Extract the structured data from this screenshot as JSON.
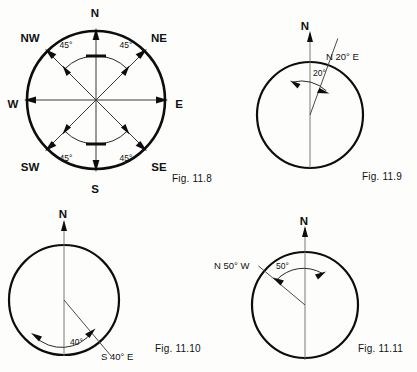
{
  "page": {
    "background_color": "#fdfdfc",
    "ink_color": "#0d0d0d",
    "width": 417,
    "height": 372
  },
  "figures": [
    {
      "id": "fig-11-8",
      "caption": "Fig. 11.8",
      "caption_x": 172,
      "caption_y": 182,
      "type": "compass-rose",
      "center_x": 96,
      "center_y": 100,
      "radius": 69,
      "cardinals": [
        {
          "label": "N",
          "bearing": 0,
          "lx": 95,
          "ly": 13
        },
        {
          "label": "NE",
          "bearing": 45,
          "lx": 156,
          "ly": 38
        },
        {
          "label": "E",
          "bearing": 90,
          "lx": 176,
          "ly": 104
        },
        {
          "label": "SE",
          "bearing": 135,
          "lx": 156,
          "ly": 167
        },
        {
          "label": "S",
          "bearing": 180,
          "lx": 95,
          "ly": 190
        },
        {
          "label": "SW",
          "bearing": 225,
          "lx": 26,
          "ly": 167
        },
        {
          "label": "W",
          "bearing": 270,
          "lx": 10,
          "ly": 104
        },
        {
          "label": "NW",
          "bearing": 315,
          "lx": 26,
          "ly": 38
        }
      ],
      "angle_labels": [
        {
          "text": "45°",
          "x": 66,
          "y": 45
        },
        {
          "text": "45°",
          "x": 124,
          "y": 45
        },
        {
          "text": "45°",
          "x": 66,
          "y": 158
        },
        {
          "text": "45°",
          "x": 124,
          "y": 158
        }
      ],
      "arcs": [
        {
          "from": 315,
          "to": 0
        },
        {
          "from": 0,
          "to": 45
        },
        {
          "from": 180,
          "to": 225
        },
        {
          "from": 135,
          "to": 180
        }
      ]
    },
    {
      "id": "fig-11-9",
      "caption": "Fig. 11.9",
      "caption_x": 362,
      "caption_y": 180,
      "type": "bearing",
      "center_x": 310,
      "center_y": 115,
      "radius": 53,
      "north_label": "N",
      "north_label_x": 305,
      "north_label_y": 26,
      "bearing_label": "N 20° E",
      "bearing_label_x": 326,
      "bearing_label_y": 57,
      "angle_text": "20°",
      "angle_text_x": 313,
      "angle_text_y": 73,
      "bearing_deg": 20,
      "direction": "east"
    },
    {
      "id": "fig-11-10",
      "caption": "Fig. 11.10",
      "caption_x": 155,
      "caption_y": 352,
      "type": "bearing",
      "center_x": 64,
      "center_y": 300,
      "radius": 55,
      "north_label": "N",
      "north_label_x": 63,
      "north_label_y": 214,
      "bearing_label": "S 40° E",
      "bearing_label_x": 103,
      "bearing_label_y": 357,
      "angle_text": "40°",
      "angle_text_x": 70,
      "angle_text_y": 342,
      "bearing_deg": 140,
      "direction": "southeast"
    },
    {
      "id": "fig-11-11",
      "caption": "Fig. 11.11",
      "caption_x": 358,
      "caption_y": 352,
      "type": "bearing",
      "center_x": 305,
      "center_y": 305,
      "radius": 53,
      "north_label": "N",
      "north_label_x": 304,
      "north_label_y": 221,
      "bearing_label": "N 50° W",
      "bearing_label_x": 214,
      "bearing_label_y": 266,
      "angle_text": "50°",
      "angle_text_x": 278,
      "angle_text_y": 266,
      "bearing_deg": 310,
      "direction": "west"
    }
  ]
}
